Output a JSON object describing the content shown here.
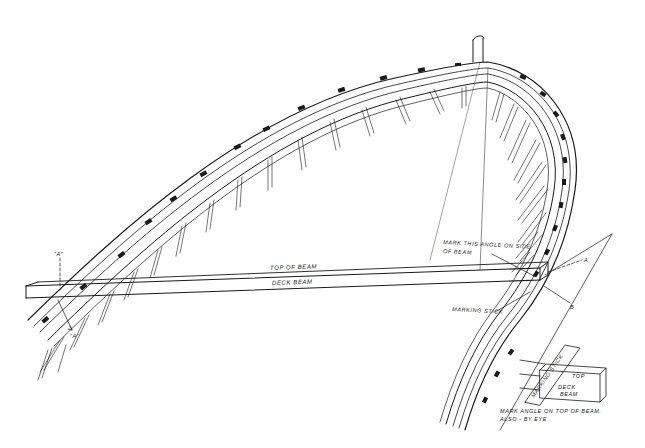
{
  "figure": {
    "type": "technical line drawing"
  },
  "labels": {
    "top_of_beam": "TOP OF BEAM",
    "deck_beam": "DECK BEAM",
    "mark_angle_side_line1": "MARK THIS ANGLE ON SIDE",
    "mark_angle_side_line2": "OF BEAM",
    "marking_stick": "MARKING STICK",
    "point_a_left_top": "\"A\"",
    "point_a_left_bottom": "\"A\"",
    "point_a_right": "A",
    "point_b_right": "B",
    "detail_marking_stick": "MARKING STICK",
    "detail_top": "TOP",
    "detail_deck": "DECK",
    "detail_beam": "BEAM",
    "caption_line1": "MARK ANGLE ON TOP OF BEAM.",
    "caption_line2": "ALSO - BY EYE"
  },
  "colors": {
    "ink": "#1a1a1a",
    "paper": "#ffffff"
  }
}
